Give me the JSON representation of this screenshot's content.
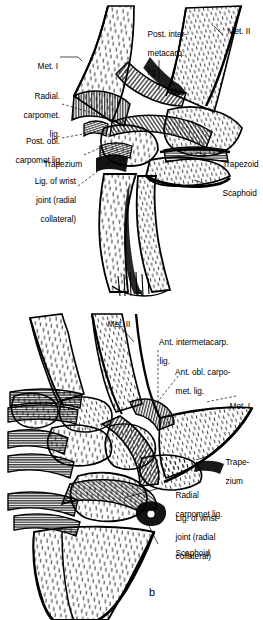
{
  "figure": {
    "background_color": "#ffffff",
    "ink_color": "#000000",
    "style": "pen-and-ink anatomical line drawing with stipple and hatch shading"
  },
  "panels": [
    {
      "id": "a",
      "letter": "a",
      "view": "posterior (dorsal) view",
      "labels": [
        {
          "id": "met-1",
          "text": "Met. I",
          "lines": [
            "Met. I"
          ],
          "side": "left",
          "leader": "solid"
        },
        {
          "id": "radial-carpomet",
          "text": "Radial. carpomet. lig.",
          "lines": [
            "Radial.",
            "carpomet.",
            "lig."
          ],
          "side": "left",
          "leader": "dashed"
        },
        {
          "id": "post-obl-carpomet",
          "text": "Post. obl. carpomet lig.",
          "lines": [
            "Post. obl.",
            "carpomet lig."
          ],
          "side": "left",
          "leader": "dashed"
        },
        {
          "id": "trapezium",
          "text": "Trapezium",
          "lines": [
            "Trapezium"
          ],
          "side": "left",
          "leader": "dashed"
        },
        {
          "id": "lig-wrist-joint",
          "text": "Lig. of wrist joint (radial collateral)",
          "lines": [
            "Lig. of wrist",
            "joint (radial",
            "collateral)"
          ],
          "side": "left",
          "leader": "dashed"
        },
        {
          "id": "post-intermetacarp",
          "text": "Post. intermetacarp. lig.",
          "lines": [
            "Post. inter-",
            "metacarp.",
            "lig."
          ],
          "side": "top",
          "leader": "solid"
        },
        {
          "id": "met-2",
          "text": "Met. II",
          "lines": [
            "Met. II"
          ],
          "side": "right",
          "leader": "solid"
        },
        {
          "id": "trapezoid",
          "text": "Trapezoid",
          "lines": [
            "Trapezoid"
          ],
          "side": "right",
          "leader": "solid"
        },
        {
          "id": "scaphoid",
          "text": "Scaphoid",
          "lines": [
            "Scaphoid"
          ],
          "side": "right",
          "leader": "solid"
        }
      ]
    },
    {
      "id": "b",
      "letter": "b",
      "view": "anterior (palmar) view",
      "labels": [
        {
          "id": "met-2",
          "text": "Met. II",
          "lines": [
            "Met. II"
          ],
          "side": "top",
          "leader": "solid"
        },
        {
          "id": "ant-intermetacarp",
          "text": "Ant. intermetacarp. lig.",
          "lines": [
            "Ant. intermetacarp.",
            "lig."
          ],
          "side": "right",
          "leader": "dashed"
        },
        {
          "id": "ant-obl-carpomet",
          "text": "Ant. obl. carpo-met. lig.",
          "lines": [
            "Ant. obl. carpo-",
            "met. lig."
          ],
          "side": "right",
          "leader": "dashed"
        },
        {
          "id": "met-1",
          "text": "Met. I",
          "lines": [
            "Met. I"
          ],
          "side": "right",
          "leader": "dashed"
        },
        {
          "id": "trapezium",
          "text": "Trape-zium",
          "lines": [
            "Trape-",
            "zium"
          ],
          "side": "right",
          "leader": "solid"
        },
        {
          "id": "radial-carpomet",
          "text": "Radial carpomet lig.",
          "lines": [
            "Radial",
            "carpomet lig."
          ],
          "side": "right",
          "leader": "solid"
        },
        {
          "id": "lig-wrist-joint",
          "text": "Lig. of wrist joint (radial collateral)",
          "lines": [
            "Lig. of wrist",
            "joint (radial",
            "collateral)"
          ],
          "side": "right",
          "leader": "solid"
        },
        {
          "id": "scaphoid",
          "text": "Scaphoid",
          "lines": [
            "Scaphoid"
          ],
          "side": "right",
          "leader": "solid"
        }
      ]
    }
  ]
}
